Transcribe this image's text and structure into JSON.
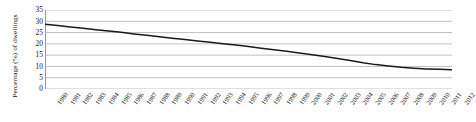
{
  "chart_data": {
    "type": "line",
    "title": "",
    "xlabel": "",
    "ylabel": "Percentage (%) of dwellings",
    "ylim": [
      0,
      35
    ],
    "yticks": [
      0,
      5,
      10,
      15,
      20,
      25,
      30,
      35
    ],
    "grid": true,
    "legend": false,
    "line_color": "#1a1a1a",
    "grid_color": "#b9b9b9",
    "categories": [
      "1980",
      "1981",
      "1982",
      "1983",
      "1984",
      "1985",
      "1986",
      "1987",
      "1988",
      "1989",
      "1990",
      "1991",
      "1992",
      "1993",
      "1994",
      "1995",
      "1996",
      "1997",
      "1998",
      "1999",
      "2000",
      "2001",
      "2002",
      "2003",
      "2004",
      "2005",
      "2006",
      "2007",
      "2008",
      "2009",
      "2010",
      "2011",
      "2012"
    ],
    "series": [
      {
        "name": "Percentage of dwellings",
        "values": [
          28.7,
          28.1,
          27.5,
          26.9,
          26.3,
          25.7,
          25.1,
          24.4,
          23.8,
          23.1,
          22.5,
          21.9,
          21.3,
          20.7,
          20.1,
          19.5,
          18.8,
          18.1,
          17.4,
          16.7,
          16.0,
          15.2,
          14.4,
          13.5,
          12.6,
          11.6,
          10.8,
          10.2,
          9.6,
          9.2,
          8.9,
          8.7,
          8.5
        ]
      }
    ]
  }
}
